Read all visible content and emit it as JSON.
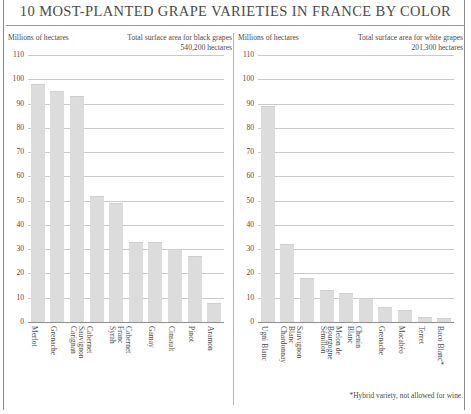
{
  "title": "10 MOST-PLANTED GRAPE VARIETIES IN FRANCE BY COLOR",
  "footnote": "*Hybrid variety, not allowed for wine.",
  "panels": {
    "black": {
      "units_label": "Millions of hectares",
      "total_line1": "Total surface area for black grapes",
      "total_line2": "540,200 hectares"
    },
    "white": {
      "units_label": "Millions of hectares",
      "total_line1": "Total surface area for white grapes",
      "total_line2": "201,300 hectares"
    }
  },
  "colors": {
    "bar": "#dcdcdc",
    "grid": "#c9c9c9",
    "axis": "#8e8e8e",
    "text": "#4a4a4a"
  },
  "chart_data": [
    {
      "type": "bar",
      "title": "Total surface area for black grapes",
      "subtitle": "540,200 hectares",
      "xlabel": "",
      "ylabel": "Millions of hectares",
      "ylim": [
        0,
        110
      ],
      "yticks": [
        110,
        100,
        90,
        80,
        70,
        60,
        50,
        40,
        30,
        20,
        10,
        0
      ],
      "grid": true,
      "legend": "none",
      "categories": [
        "Merlot",
        "Grenache",
        "Carignan",
        "Cabernet Sauvignon",
        "Syrah",
        "Cabernet Franc",
        "Gamay",
        "Cinsault",
        "Pinot",
        "Aramon"
      ],
      "values": [
        98,
        95,
        93,
        52,
        49,
        33,
        33,
        30,
        27,
        8
      ]
    },
    {
      "type": "bar",
      "title": "Total surface area for white grapes",
      "subtitle": "201,300 hectares",
      "xlabel": "",
      "ylabel": "Millions of hectares",
      "ylim": [
        0,
        110
      ],
      "yticks": [
        110,
        100,
        90,
        80,
        70,
        60,
        50,
        40,
        30,
        20,
        10,
        0
      ],
      "grid": true,
      "legend": "none",
      "categories": [
        "Ugni Blanc",
        "Chardonnay",
        "Sauvignon Blanc",
        "Sémillon",
        "Melon de Bourgogne",
        "Chenin Blanc",
        "Grenache",
        "Macabéo",
        "Terret",
        "Baco Blanc*"
      ],
      "values": [
        89,
        32,
        18,
        13,
        12,
        10,
        6,
        5,
        2,
        1.5
      ]
    }
  ]
}
